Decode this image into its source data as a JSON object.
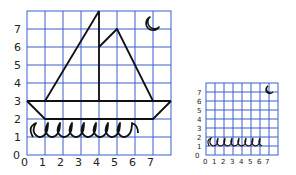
{
  "large_grid": {
    "x_labels": [
      "0",
      "1",
      "2",
      "3",
      "4",
      "5",
      "6",
      "7"
    ],
    "y_labels": [
      "0",
      "1",
      "2",
      "3",
      "4",
      "5",
      "6",
      "7"
    ],
    "origin_label": "0",
    "cols": 8,
    "rows": 8,
    "grid_color": "#3a5fcd",
    "drawing": "sailboat with crescent moon and waves"
  },
  "small_grid": {
    "x_labels": [
      "0",
      "1",
      "2",
      "3",
      "4",
      "5",
      "6",
      "7"
    ],
    "y_labels": [
      "0",
      "1",
      "2",
      "3",
      "4",
      "5",
      "6",
      "7"
    ],
    "cols": 8,
    "rows": 8,
    "grid_color": "#3a5fcd",
    "drawing": "waves and crescent moon"
  },
  "colors": {
    "grid": "#3a5fcd",
    "ink": "#111111",
    "background": "#ffffff"
  }
}
